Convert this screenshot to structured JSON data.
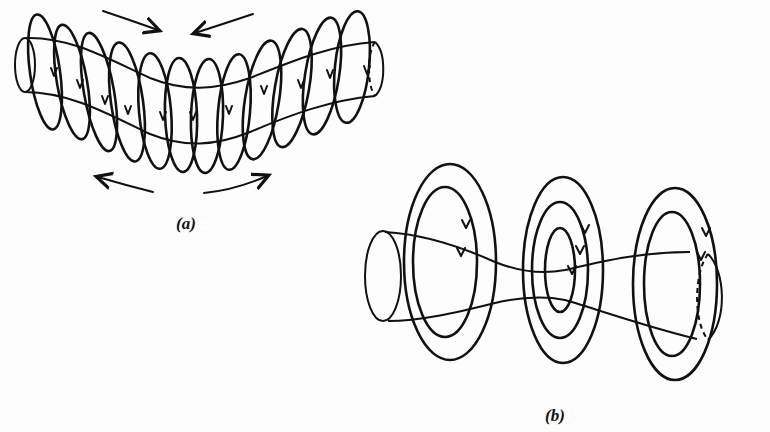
{
  "figure": {
    "panels": [
      {
        "id": "a",
        "label": "(a)",
        "depicts": "kink instability: bent plasma column with azimuthal field loops crowded on concave side, arrows showing field pressure",
        "field_loop_count": 13,
        "pressure_arrows": 4
      },
      {
        "id": "b",
        "label": "(b)",
        "depicts": "sausage instability: necked plasma column with concentric field rings, stronger field at constriction",
        "ring_groups": 3,
        "rings_per_group": [
          2,
          3,
          2
        ]
      }
    ]
  },
  "colors": {
    "ink": "#111111",
    "paper": "#fdfdfd",
    "bleed_through": "#f1f1f1"
  }
}
